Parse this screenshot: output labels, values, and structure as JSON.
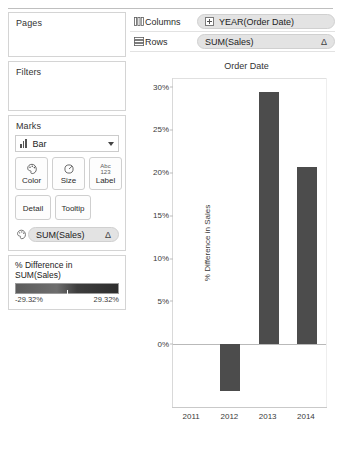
{
  "shelves": {
    "pages_label": "Pages",
    "filters_label": "Filters",
    "marks_label": "Marks",
    "marks_type": "Bar",
    "marks_type_icon": "bar-mark-icon",
    "buttons": [
      {
        "label": "Color",
        "icon": "color-palette-icon"
      },
      {
        "label": "Size",
        "icon": "size-circle-icon"
      },
      {
        "label": "Label",
        "icon": "abc-123-icon",
        "icon_top": "Abc",
        "icon_bottom": "123"
      },
      {
        "label": "Detail",
        "icon": "detail-icon"
      },
      {
        "label": "Tooltip",
        "icon": "tooltip-icon"
      }
    ],
    "marks_field": {
      "icon": "color-palette-icon",
      "text": "SUM(Sales)",
      "badge": "Δ"
    }
  },
  "legend": {
    "title": "% Difference in SUM(Sales)",
    "min": "-29.32%",
    "max": "29.32%",
    "ramp_start": "#5c5c5c",
    "ramp_end": "#2e2e2e"
  },
  "columns_shelf": {
    "icon": "columns-icon",
    "name": "Columns",
    "pill_text": "YEAR(Order Date)",
    "pill_expand": "plus-box-icon"
  },
  "rows_shelf": {
    "icon": "rows-icon",
    "name": "Rows",
    "pill_text": "SUM(Sales)",
    "badge": "Δ"
  },
  "chart_data": {
    "type": "bar",
    "title": "Order Date",
    "xlabel": "",
    "ylabel": "% Difference in Sales",
    "categories": [
      "2011",
      "2012",
      "2013",
      "2014"
    ],
    "values": [
      0,
      -5.5,
      29.32,
      20.6
    ],
    "value_labels": [
      "0%",
      "-5.5%",
      "29.32%",
      "20.6%"
    ],
    "ylim": [
      -7.5,
      31
    ],
    "yticks": [
      0,
      5,
      10,
      15,
      20,
      25,
      30
    ],
    "ytick_labels": [
      "0%",
      "5%",
      "10%",
      "15%",
      "20%",
      "25%",
      "30%"
    ],
    "grid": false,
    "legend": "none",
    "bar_color": "#4c4c4c"
  }
}
